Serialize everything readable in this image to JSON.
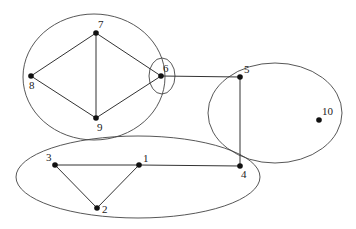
{
  "diagram": {
    "type": "graph-with-groupings",
    "nodes": [
      {
        "id": "1",
        "label": "1",
        "x": 139,
        "y": 165,
        "lx": 143,
        "ly": 162
      },
      {
        "id": "2",
        "label": "2",
        "x": 97,
        "y": 208,
        "lx": 102,
        "ly": 213
      },
      {
        "id": "3",
        "label": "3",
        "x": 55,
        "y": 165,
        "lx": 46,
        "ly": 161
      },
      {
        "id": "4",
        "label": "4",
        "x": 240,
        "y": 166,
        "lx": 241,
        "ly": 178
      },
      {
        "id": "5",
        "label": "5",
        "x": 240,
        "y": 77,
        "lx": 244,
        "ly": 73
      },
      {
        "id": "6",
        "label": "6",
        "x": 161,
        "y": 76,
        "lx": 163,
        "ly": 72
      },
      {
        "id": "7",
        "label": "7",
        "x": 96,
        "y": 33,
        "lx": 98,
        "ly": 28
      },
      {
        "id": "8",
        "label": "8",
        "x": 31,
        "y": 76,
        "lx": 29,
        "ly": 89
      },
      {
        "id": "9",
        "label": "9",
        "x": 96,
        "y": 118,
        "lx": 97,
        "ly": 131
      },
      {
        "id": "10",
        "label": "10",
        "x": 319,
        "y": 120,
        "lx": 322,
        "ly": 115
      }
    ],
    "edges": [
      [
        "7",
        "8"
      ],
      [
        "7",
        "9"
      ],
      [
        "8",
        "9"
      ],
      [
        "7",
        "6"
      ],
      [
        "9",
        "6"
      ],
      [
        "6",
        "5"
      ],
      [
        "5",
        "4"
      ],
      [
        "3",
        "1"
      ],
      [
        "1",
        "4"
      ],
      [
        "3",
        "2"
      ],
      [
        "1",
        "2"
      ]
    ],
    "groups": [
      {
        "name": "group-7-8-9",
        "cx": 94,
        "cy": 77,
        "rx": 71,
        "ry": 63
      },
      {
        "name": "group-6",
        "cx": 162,
        "cy": 76,
        "rx": 13,
        "ry": 18
      },
      {
        "name": "group-5-10",
        "cx": 275,
        "cy": 113,
        "rx": 67,
        "ry": 50
      },
      {
        "name": "group-1-2-3-4",
        "cx": 138,
        "cy": 177,
        "rx": 122,
        "ry": 41
      }
    ]
  }
}
